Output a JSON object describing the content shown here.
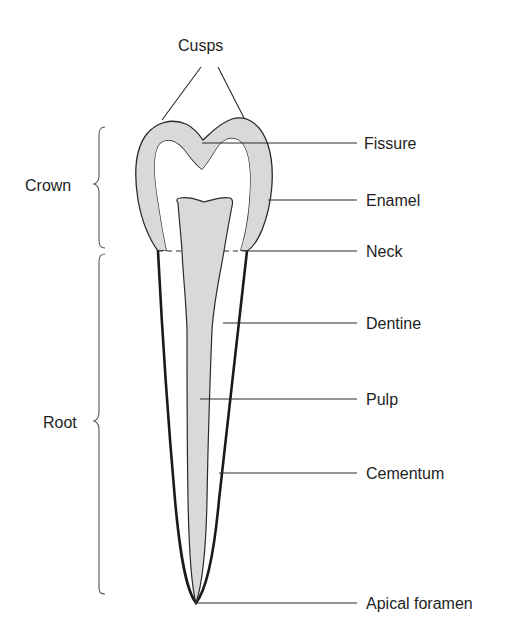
{
  "diagram": {
    "type": "anatomical-cross-section",
    "colors": {
      "background": "#ffffff",
      "enamel_fill": "#d9d9d9",
      "pulp_fill": "#d9d9d9",
      "outline": "#2a2a2a",
      "text": "#1e1e1e"
    },
    "top_label": {
      "text": "Cusps",
      "points_to": [
        "left cusp",
        "right cusp"
      ]
    },
    "left_labels": [
      {
        "id": "crown",
        "text": "Crown",
        "bracket": "curly-brace",
        "spans": "top of cusps to neck"
      },
      {
        "id": "root",
        "text": "Root",
        "bracket": "curly-brace",
        "spans": "neck to apical foramen"
      }
    ],
    "right_labels": [
      {
        "id": "fissure",
        "text": "Fissure"
      },
      {
        "id": "enamel",
        "text": "Enamel"
      },
      {
        "id": "neck",
        "text": "Neck"
      },
      {
        "id": "dentine",
        "text": "Dentine"
      },
      {
        "id": "pulp",
        "text": "Pulp"
      },
      {
        "id": "cementum",
        "text": "Cementum"
      },
      {
        "id": "apical_foramen",
        "text": "Apical foramen"
      }
    ]
  }
}
